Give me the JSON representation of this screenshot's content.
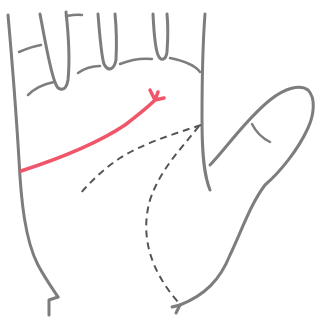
{
  "figure": {
    "subject": "palm illustration",
    "colors": {
      "outline": "#7d7d7d",
      "dashed_lines": "#555555",
      "highlighted_line": "#f0566a",
      "background": "#ffffff"
    },
    "elements": [
      {
        "name": "hand-outline",
        "style": "solid gray"
      },
      {
        "name": "finger-creases",
        "style": "solid gray"
      },
      {
        "name": "thumb",
        "style": "solid gray"
      },
      {
        "name": "highlighted-palm-line",
        "style": "solid red, forked end"
      },
      {
        "name": "dashed-line-left",
        "style": "dashed gray"
      },
      {
        "name": "dashed-line-lower",
        "style": "dashed gray"
      }
    ]
  }
}
